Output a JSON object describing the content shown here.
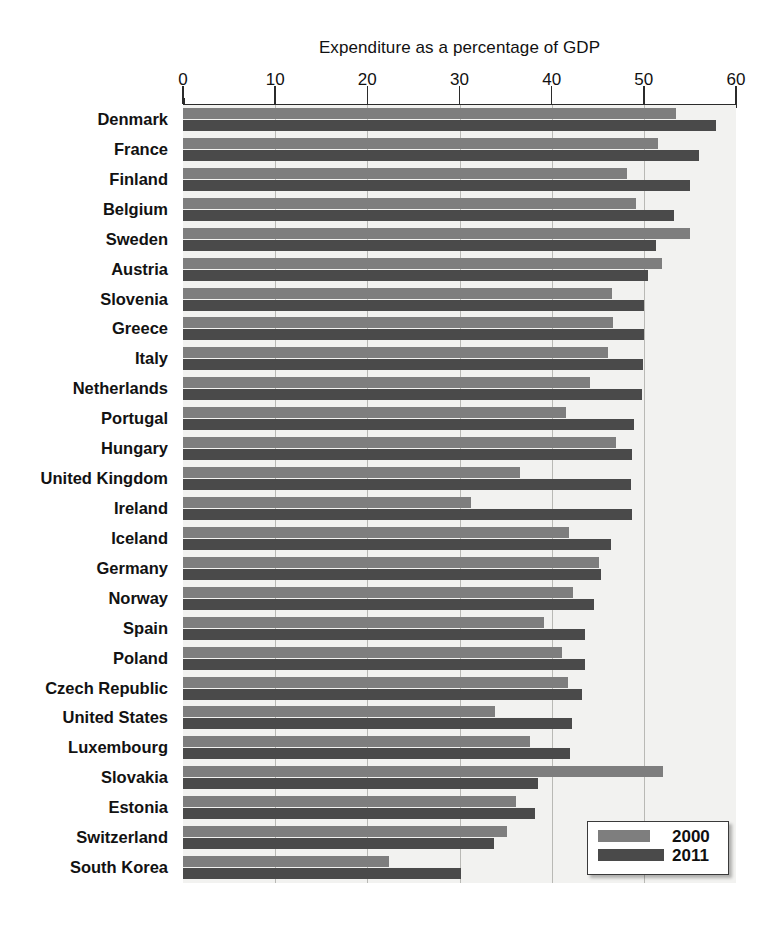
{
  "chart_data": {
    "type": "bar",
    "orientation": "horizontal",
    "title": "",
    "xlabel": "Expenditure as a percentage of GDP",
    "ylabel": "",
    "xlim": [
      0,
      60
    ],
    "xticks": [
      0,
      10,
      20,
      30,
      40,
      50,
      60
    ],
    "xtick_labels": [
      "0",
      "10",
      "20",
      "30",
      "40",
      "50",
      "60"
    ],
    "grid": "vertical",
    "legend_position": "bottom-right",
    "categories": [
      "Denmark",
      "France",
      "Finland",
      "Belgium",
      "Sweden",
      "Austria",
      "Slovenia",
      "Greece",
      "Italy",
      "Netherlands",
      "Portugal",
      "Hungary",
      "United Kingdom",
      "Ireland",
      "Iceland",
      "Germany",
      "Norway",
      "Spain",
      "Poland",
      "Czech Republic",
      "United States",
      "Luxembourg",
      "Slovakia",
      "Estonia",
      "Switzerland",
      "South Korea"
    ],
    "series": [
      {
        "name": "2000",
        "color": "#7e7e7e",
        "values": [
          53.5,
          51.5,
          48.2,
          49.1,
          55.0,
          52.0,
          46.5,
          46.7,
          46.1,
          44.2,
          41.6,
          47.0,
          36.6,
          31.2,
          41.9,
          45.1,
          42.3,
          39.2,
          41.1,
          41.8,
          33.9,
          37.6,
          52.1,
          36.1,
          35.1,
          22.4
        ]
      },
      {
        "name": "2011",
        "color": "#4a4a4a",
        "values": [
          57.8,
          56.0,
          55.0,
          53.3,
          51.3,
          50.5,
          50.0,
          50.0,
          49.9,
          49.8,
          48.9,
          48.7,
          48.6,
          48.7,
          46.4,
          45.3,
          44.6,
          43.6,
          43.6,
          43.3,
          42.2,
          42.0,
          38.5,
          38.2,
          33.7,
          30.2
        ]
      }
    ]
  },
  "legend": {
    "items": [
      {
        "label": "2000",
        "color": "#7e7e7e"
      },
      {
        "label": "2011",
        "color": "#4a4a4a"
      }
    ]
  },
  "caption": ""
}
